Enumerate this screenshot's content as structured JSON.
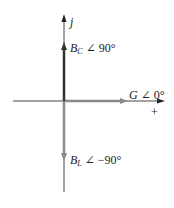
{
  "diagram": {
    "type": "phasor-diagram",
    "axes": {
      "vertical_label": "j",
      "horizontal_label": "+"
    },
    "phasors": [
      {
        "name": "B",
        "subscript": "C",
        "angle_text": "∠ 90°",
        "direction": "up",
        "color": "#333333"
      },
      {
        "name": "G",
        "subscript": "",
        "angle_text": "∠ 0°",
        "direction": "right",
        "color": "#8a8a8a"
      },
      {
        "name": "B",
        "subscript": "L",
        "angle_text": "∠ −90°",
        "direction": "down",
        "color": "#8a8a8a"
      }
    ],
    "colors": {
      "axis": "#444444",
      "bc_vector": "#333333",
      "g_vector": "#8a8a8a",
      "bl_vector": "#8a8a8a"
    }
  }
}
